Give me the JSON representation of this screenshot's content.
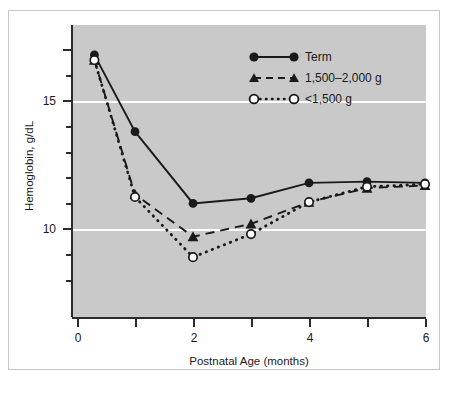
{
  "chart_data": {
    "type": "line",
    "title": "",
    "xlabel": "Postnatal Age (months)",
    "ylabel": "Hemoglobin, g/dL",
    "xlim": [
      -0.1,
      6.1
    ],
    "ylim": [
      7.0,
      17.6
    ],
    "xticks": [
      0,
      1,
      2,
      3,
      4,
      5,
      6
    ],
    "xtick_labels": [
      "0",
      "",
      "2",
      "",
      "4",
      "",
      "6"
    ],
    "yticks": [
      8,
      9,
      10,
      11,
      12,
      13,
      14,
      15,
      16,
      17
    ],
    "ytick_labels": [
      "",
      "",
      "10",
      "",
      "",
      "",
      "",
      "15",
      "",
      ""
    ],
    "major_yticks": [
      10,
      15
    ],
    "gridlines": [
      10,
      15
    ],
    "grid": true,
    "grid_color": "#ffffff",
    "plot_background": "#c9c9c9",
    "legend_position": "upper right",
    "series": [
      {
        "name": "Term",
        "marker": "filled-circle",
        "linestyle": "solid",
        "color": "#1a1a1a",
        "x": [
          0.3,
          1,
          2,
          3,
          4,
          5,
          6
        ],
        "values": [
          16.8,
          13.8,
          11.0,
          11.2,
          11.8,
          11.85,
          11.8
        ]
      },
      {
        "name": "1,500–2,000 g",
        "marker": "filled-triangle",
        "linestyle": "dashed",
        "color": "#1a1a1a",
        "x": [
          0.3,
          1,
          2,
          3,
          4,
          5,
          6
        ],
        "values": [
          16.6,
          11.35,
          9.7,
          10.2,
          11.05,
          11.6,
          11.7
        ]
      },
      {
        "name": "<1,500 g",
        "marker": "open-circle",
        "linestyle": "dotted",
        "color": "#1a1a1a",
        "x": [
          0.3,
          1,
          2,
          3,
          4,
          5,
          6
        ],
        "values": [
          16.6,
          11.25,
          8.9,
          9.8,
          11.05,
          11.65,
          11.75
        ]
      }
    ]
  },
  "axes": {
    "y_title": "Hemoglobin, g/dL",
    "x_title": "Postnatal Age (months)",
    "y_label_15": "15",
    "y_label_10": "10",
    "x_label_0": "0",
    "x_label_2": "2",
    "x_label_4": "4",
    "x_label_6": "6"
  },
  "legend": {
    "items": [
      {
        "label": "Term",
        "marker": "filled-circle",
        "linestyle": "solid"
      },
      {
        "label": "1,500–2,000 g",
        "marker": "filled-triangle",
        "linestyle": "dashed"
      },
      {
        "label": "<1,500 g",
        "marker": "open-circle",
        "linestyle": "dotted"
      }
    ]
  }
}
